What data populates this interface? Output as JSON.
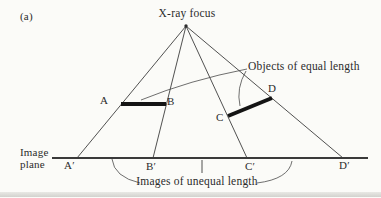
{
  "figure": {
    "panel_label": "(a)",
    "focus_label": "X-ray focus",
    "image_plane_label_line1": "Image",
    "image_plane_label_line2": "plane",
    "objects_annotation": "Objects of equal length",
    "images_annotation": "Images of unequal length",
    "object_points": {
      "a": "A",
      "b": "B",
      "c": "C",
      "d": "D"
    },
    "image_points": {
      "a": "A′",
      "b": "B′",
      "c": "C′",
      "d": "D′"
    },
    "colors": {
      "line": "#3d3d3d",
      "plane_line": "#3a3a3a",
      "object_bar": "#141414",
      "text": "#2b2b2b",
      "background": "#fbfbf8"
    }
  }
}
